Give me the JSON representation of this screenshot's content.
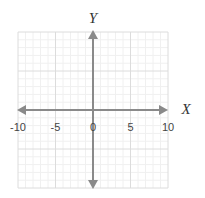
{
  "chart_data": {
    "type": "line",
    "title": "",
    "xlabel": "X",
    "ylabel": "Y",
    "xlim": [
      -10,
      10
    ],
    "ylim": [
      -10,
      10
    ],
    "x_ticks": [
      -10,
      -5,
      0,
      5,
      10
    ],
    "x_tick_labels": [
      "-10",
      "-5",
      "0",
      "5",
      "10"
    ],
    "y_ticks": [],
    "grid": true,
    "grid_major_step": 5,
    "grid_minor_step": 1,
    "series": [],
    "legend": null
  },
  "colors": {
    "axis": "#8a8a8a",
    "grid_major": "#dcdcdc",
    "grid_minor": "#f0f0f0",
    "text": "#444444"
  }
}
